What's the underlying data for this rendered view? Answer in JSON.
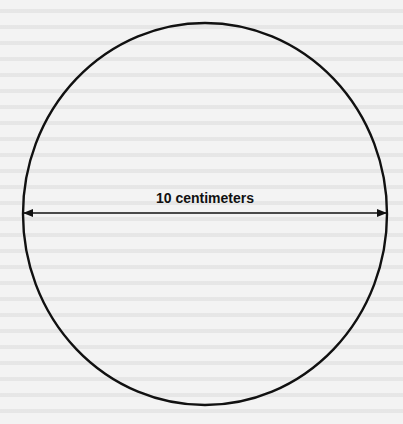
{
  "diagram": {
    "type": "circle-with-diameter",
    "diameter_label": "10 centimeters",
    "colors": {
      "stroke": "#111111",
      "background": "#f3f3f3"
    },
    "circle": {
      "cx": 205,
      "cy": 214,
      "rx": 182,
      "ry": 191
    },
    "diameter_line": {
      "x1": 23,
      "x2": 387,
      "y": 213
    }
  }
}
